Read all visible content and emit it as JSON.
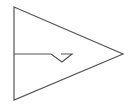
{
  "diagram": {
    "type": "symbol",
    "stroke_color": "#555555",
    "background": "#ffffff",
    "shapes": {
      "triangle": {
        "points": "14,7 123,54 14,100"
      },
      "input_line": {
        "points": "14,54 51,54 62,62 72,54 61,54"
      }
    }
  }
}
